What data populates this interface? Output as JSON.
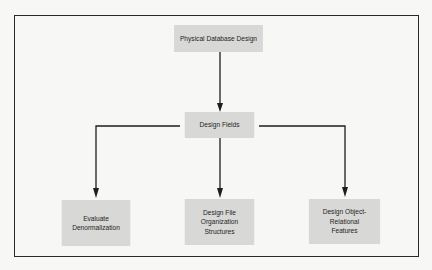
{
  "diagram": {
    "type": "hierarchy-flow",
    "nodes": {
      "top": {
        "label": "Physical Database Design"
      },
      "fields": {
        "label": "Design Fields"
      },
      "denormalization": {
        "label": "Evaluate\nDenormalization"
      },
      "file_org": {
        "label": "Design File\nOrganization\nStructures"
      },
      "object_relational": {
        "label": "Design Object-\nRelational\nFeatures"
      }
    },
    "edges": [
      {
        "from": "Physical Database Design",
        "to": "Design Fields"
      },
      {
        "from": "Design Fields",
        "to": "Evaluate Denormalization"
      },
      {
        "from": "Design Fields",
        "to": "Design File Organization Structures"
      },
      {
        "from": "Design Fields",
        "to": "Design Object-Relational Features"
      }
    ],
    "colors": {
      "node_fill": "#d8d8d6",
      "line": "#1e1e1e",
      "frame": "#2a2a2a",
      "background": "#f7f7f5"
    }
  }
}
